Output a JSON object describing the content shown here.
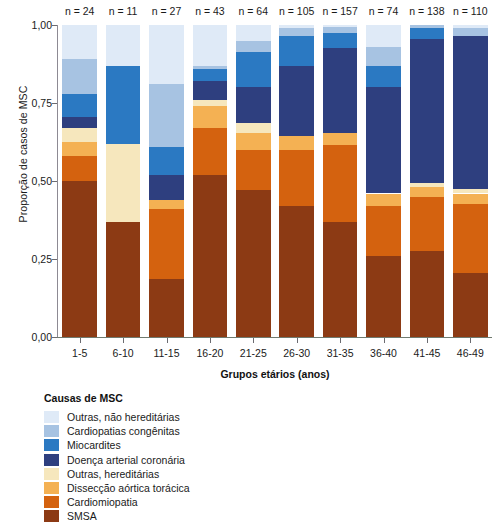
{
  "chart_data": {
    "type": "bar",
    "subtype": "stacked-proportional",
    "title": "",
    "xlabel": "Grupos etários (anos)",
    "ylabel": "Proporção de casos de MSC",
    "ylim": [
      0,
      1
    ],
    "ytick_labels": [
      "0,00",
      "0,25",
      "0,50",
      "0,75",
      "1,00"
    ],
    "ytick_values": [
      0,
      0.25,
      0.5,
      0.75,
      1
    ],
    "grid": false,
    "legend_position": "below-left",
    "legend_title": "Causas de MSC",
    "categories": [
      "1-5",
      "6-10",
      "11-15",
      "16-20",
      "21-25",
      "26-30",
      "31-35",
      "36-40",
      "41-45",
      "46-49"
    ],
    "counts": [
      "n = 24",
      "n = 11",
      "n = 27",
      "n = 43",
      "n = 64",
      "n = 105",
      "n = 157",
      "n = 74",
      "n = 138",
      "n = 110"
    ],
    "count_values": [
      24,
      11,
      27,
      43,
      64,
      105,
      157,
      74,
      138,
      110
    ],
    "series": [
      {
        "name": "SMSA",
        "color": "#8c3a14",
        "values": [
          0.5,
          0.37,
          0.185,
          0.52,
          0.47,
          0.42,
          0.37,
          0.26,
          0.275,
          0.205
        ]
      },
      {
        "name": "Cardiomiopatia",
        "color": "#d4620f",
        "values": [
          0.08,
          0.0,
          0.225,
          0.15,
          0.13,
          0.18,
          0.245,
          0.16,
          0.175,
          0.22
        ]
      },
      {
        "name": "Dissecção aórtica torácica",
        "color": "#f4b153",
        "values": [
          0.045,
          0.0,
          0.03,
          0.07,
          0.055,
          0.045,
          0.04,
          0.04,
          0.03,
          0.035
        ]
      },
      {
        "name": "Outras, hereditárias",
        "color": "#f6e7bd",
        "values": [
          0.045,
          0.25,
          0.0,
          0.02,
          0.03,
          0.0,
          0.0,
          0.0,
          0.015,
          0.015
        ]
      },
      {
        "name": "Doença arterial coronária",
        "color": "#2e3f7f",
        "values": [
          0.035,
          0.0,
          0.08,
          0.06,
          0.115,
          0.225,
          0.27,
          0.34,
          0.46,
          0.49
        ]
      },
      {
        "name": "Miocardites",
        "color": "#2b79c2",
        "values": [
          0.075,
          0.25,
          0.09,
          0.04,
          0.115,
          0.095,
          0.05,
          0.07,
          0.035,
          0.0
        ]
      },
      {
        "name": "Cardiopatias congênitas",
        "color": "#a7c3e2",
        "values": [
          0.11,
          0.0,
          0.2,
          0.01,
          0.035,
          0.025,
          0.02,
          0.06,
          0.01,
          0.025
        ]
      },
      {
        "name": "Outras, não hereditárias",
        "color": "#dfeaf7",
        "values": [
          0.11,
          0.13,
          0.19,
          0.13,
          0.05,
          0.01,
          0.005,
          0.07,
          0.0,
          0.01
        ]
      }
    ],
    "legend_entries": [
      {
        "label": "Outras, não hereditárias",
        "color": "#dfeaf7"
      },
      {
        "label": "Cardiopatias congênitas",
        "color": "#a7c3e2"
      },
      {
        "label": "Miocardites",
        "color": "#2b79c2"
      },
      {
        "label": "Doença arterial coronária",
        "color": "#2e3f7f"
      },
      {
        "label": "Outras, hereditárias",
        "color": "#f6e7bd"
      },
      {
        "label": "Dissecção aórtica torácica",
        "color": "#f4b153"
      },
      {
        "label": "Cardiomiopatia",
        "color": "#d4620f"
      },
      {
        "label": "SMSA",
        "color": "#8c3a14"
      }
    ]
  }
}
